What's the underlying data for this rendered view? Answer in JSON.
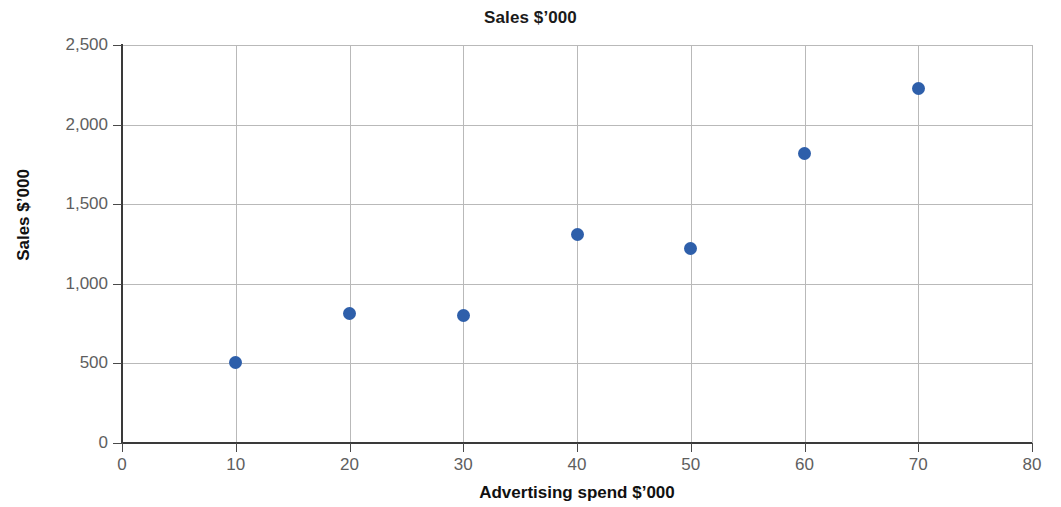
{
  "chart_data": {
    "type": "scatter",
    "title": "Sales $’000",
    "xlabel": "Advertising spend $’000",
    "ylabel": "Sales $’000",
    "xlim": [
      0,
      80
    ],
    "ylim": [
      0,
      2500
    ],
    "grid": true,
    "legend": "none",
    "marker_color": "#2e5faa",
    "gridline_color": "#b9b9b9",
    "axis_color": "#3a3a3a",
    "tick_label_color": "#5e5e5e",
    "x_ticks": [
      "0",
      "10",
      "20",
      "30",
      "40",
      "50",
      "60",
      "70",
      "80"
    ],
    "x_tick_values": [
      0,
      10,
      20,
      30,
      40,
      50,
      60,
      70,
      80
    ],
    "y_ticks": [
      "0",
      "500",
      "1,000",
      "1,500",
      "2,000",
      "2,500"
    ],
    "y_tick_values": [
      0,
      500,
      1000,
      1500,
      2000,
      2500
    ],
    "series": [
      {
        "name": "Sales",
        "x": [
          10,
          20,
          30,
          40,
          50,
          60,
          70
        ],
        "y": [
          505,
          815,
          800,
          1310,
          1220,
          1820,
          2225
        ]
      }
    ],
    "points": [
      {
        "x": 10,
        "y": 505
      },
      {
        "x": 20,
        "y": 815
      },
      {
        "x": 30,
        "y": 800
      },
      {
        "x": 40,
        "y": 1310
      },
      {
        "x": 50,
        "y": 1220
      },
      {
        "x": 60,
        "y": 1820
      },
      {
        "x": 70,
        "y": 2225
      }
    ]
  }
}
